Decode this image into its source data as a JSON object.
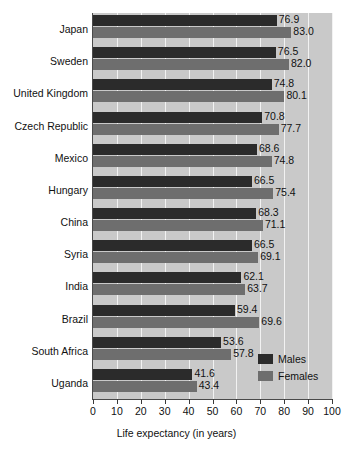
{
  "chart_data": {
    "type": "bar",
    "orientation": "horizontal",
    "title": "",
    "xlabel": "Life expectancy (in years)",
    "ylabel": "",
    "xlim": [
      0,
      100
    ],
    "xticks": [
      0,
      10,
      20,
      30,
      40,
      50,
      60,
      70,
      80,
      90,
      100
    ],
    "grid": true,
    "grid_axis": "x",
    "legend_position": "bottom-right",
    "categories": [
      "Japan",
      "Sweden",
      "United Kingdom",
      "Czech Republic",
      "Mexico",
      "Hungary",
      "China",
      "Syria",
      "India",
      "Brazil",
      "South Africa",
      "Uganda"
    ],
    "series": [
      {
        "name": "Males",
        "color": "#2b2b2b",
        "values": [
          76.9,
          76.5,
          74.8,
          70.8,
          68.6,
          66.5,
          68.3,
          66.5,
          62.1,
          59.4,
          53.6,
          41.6
        ],
        "labels": [
          "76.9",
          "76.5",
          "74.8",
          "70.8",
          "68.6",
          "66.5",
          "68.3",
          "66.5",
          "62.1",
          "59.4",
          "53.6",
          "41.6"
        ]
      },
      {
        "name": "Females",
        "color": "#6e6e6e",
        "values": [
          83.0,
          82.0,
          80.1,
          77.7,
          74.8,
          75.4,
          71.1,
          69.1,
          63.7,
          69.6,
          57.8,
          43.4
        ],
        "labels": [
          "83.0",
          "82.0",
          "80.1",
          "77.7",
          "74.8",
          "75.4",
          "71.1",
          "69.1",
          "63.7",
          "69.6",
          "57.8",
          "43.4"
        ]
      }
    ]
  },
  "colors": {
    "plot_background": "#c9c9c9",
    "page_background": "#ffffff",
    "gridline": "#f2f2f2",
    "axis": "#4a4a4a",
    "males": "#2b2b2b",
    "females": "#6e6e6e"
  }
}
